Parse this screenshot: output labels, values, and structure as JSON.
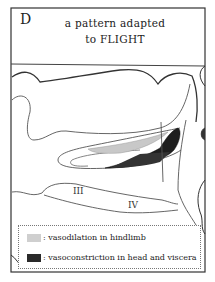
{
  "panel": {
    "letter": "D",
    "title_line1": "a pattern adapted",
    "title_line2": "to FLIGHT"
  },
  "diagram": {
    "region_labels": [
      "III",
      "IV"
    ],
    "colors": {
      "vasodilation": "#c8c8c8",
      "vasoconstriction": "#1e1e1e",
      "outline": "#444444"
    }
  },
  "legend": {
    "items": [
      {
        "swatch": "light-gray",
        "label": ": vasodilation in hindlimb"
      },
      {
        "swatch": "dark",
        "label": ": vasoconstriction in head and viscera"
      }
    ]
  }
}
